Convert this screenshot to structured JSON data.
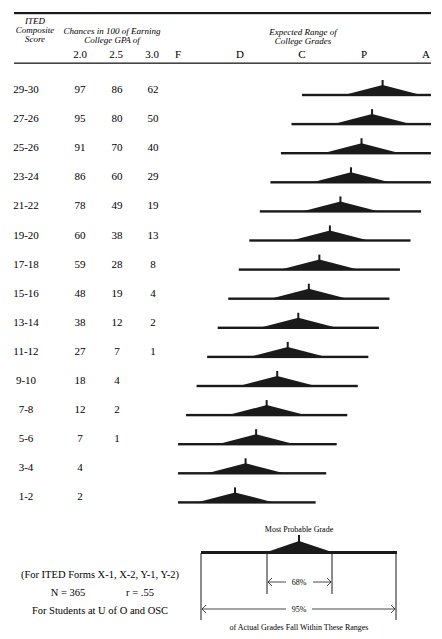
{
  "header": {
    "score_label_lines": [
      "ITED",
      "Composite",
      "Score"
    ],
    "chances_label_lines": [
      "Chances in 100 of Earning",
      "College GPA of"
    ],
    "gpa_columns": [
      "2.0",
      "2.5",
      "3.0"
    ],
    "range_label_lines": [
      "Expected Range of",
      "College Grades"
    ],
    "grade_letters": [
      "F",
      "D",
      "C",
      "P",
      "A"
    ]
  },
  "rows": [
    {
      "score": "29-30",
      "gpa_2_0": "97",
      "gpa_2_5": "86",
      "gpa_3_0": "62"
    },
    {
      "score": "27-26",
      "gpa_2_0": "95",
      "gpa_2_5": "80",
      "gpa_3_0": "50"
    },
    {
      "score": "25-26",
      "gpa_2_0": "91",
      "gpa_2_5": "70",
      "gpa_3_0": "40"
    },
    {
      "score": "23-24",
      "gpa_2_0": "86",
      "gpa_2_5": "60",
      "gpa_3_0": "29"
    },
    {
      "score": "21-22",
      "gpa_2_0": "78",
      "gpa_2_5": "49",
      "gpa_3_0": "19"
    },
    {
      "score": "19-20",
      "gpa_2_0": "60",
      "gpa_2_5": "38",
      "gpa_3_0": "13"
    },
    {
      "score": "17-18",
      "gpa_2_0": "59",
      "gpa_2_5": "28",
      "gpa_3_0": "8"
    },
    {
      "score": "15-16",
      "gpa_2_0": "48",
      "gpa_2_5": "19",
      "gpa_3_0": "4"
    },
    {
      "score": "13-14",
      "gpa_2_0": "38",
      "gpa_2_5": "12",
      "gpa_3_0": "2"
    },
    {
      "score": "11-12",
      "gpa_2_0": "27",
      "gpa_2_5": "7",
      "gpa_3_0": "1"
    },
    {
      "score": "9-10",
      "gpa_2_0": "18",
      "gpa_2_5": "4",
      "gpa_3_0": ""
    },
    {
      "score": "7-8",
      "gpa_2_0": "12",
      "gpa_2_5": "2",
      "gpa_3_0": ""
    },
    {
      "score": "5-6",
      "gpa_2_0": "7",
      "gpa_2_5": "1",
      "gpa_3_0": ""
    },
    {
      "score": "3-4",
      "gpa_2_0": "4",
      "gpa_2_5": "",
      "gpa_3_0": ""
    },
    {
      "score": "1-2",
      "gpa_2_0": "2",
      "gpa_2_5": "",
      "gpa_3_0": ""
    }
  ],
  "chart_data": {
    "type": "range-triangle",
    "title": "Expected Range of College Grades",
    "x_scale": {
      "labels": [
        "F",
        "D",
        "C",
        "P",
        "A"
      ],
      "values": [
        0,
        1,
        2,
        3,
        4
      ]
    },
    "categories": [
      "29-30",
      "27-26",
      "25-26",
      "23-24",
      "21-22",
      "19-20",
      "17-18",
      "15-16",
      "13-14",
      "11-12",
      "9-10",
      "7-8",
      "5-6",
      "3-4",
      "1-2"
    ],
    "most_probable_grade": [
      3.3,
      3.13,
      2.96,
      2.79,
      2.62,
      2.45,
      2.28,
      2.11,
      1.94,
      1.77,
      1.6,
      1.43,
      1.26,
      1.09,
      0.92
    ],
    "range_68_halfwidth": 0.62,
    "range_95_halfwidth": 1.3,
    "range_clip": [
      0,
      4.08
    ],
    "grid": false
  },
  "footnote": {
    "forms": "(For ITED Forms X-1, X-2, Y-1, Y-2)",
    "n": "N = 365",
    "r": "r = .55",
    "population": "For Students at U of O and OSC"
  },
  "legend": {
    "peak_label": "Most Probable Grade",
    "inner_label": "68%",
    "outer_label": "95%",
    "caption": "of Actual Grades Fall Within These Ranges"
  },
  "colors": {
    "ink": "#1a1a1a"
  }
}
